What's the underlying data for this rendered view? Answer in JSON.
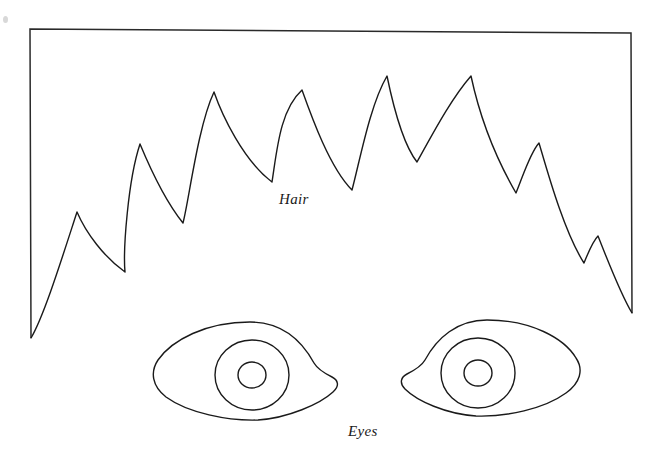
{
  "page": {
    "width": 665,
    "height": 460,
    "background_color": "#ffffff",
    "ink_color": "#1a1a1a"
  },
  "labels": {
    "hair": "Hair",
    "eyes": "Eyes"
  },
  "figure": {
    "frame": {
      "description": "open rectangle border: left vertical, top horizontal, right vertical",
      "top_left": [
        30,
        29
      ],
      "top_right": [
        631,
        33
      ],
      "left_bottom": [
        31,
        338
      ],
      "right_bottom": [
        632,
        313
      ],
      "color": "#2a2a2a"
    },
    "hair": {
      "description": "spiky zigzag hairline drawn between the two frame bottoms",
      "peaks": [
        [
          77,
          212
        ],
        [
          140,
          144
        ],
        [
          214,
          92
        ],
        [
          302,
          90
        ],
        [
          387,
          76
        ],
        [
          471,
          76
        ],
        [
          539,
          143
        ],
        [
          598,
          236
        ]
      ],
      "valleys": [
        [
          31,
          338
        ],
        [
          125,
          272
        ],
        [
          183,
          223
        ],
        [
          272,
          182
        ],
        [
          352,
          190
        ],
        [
          417,
          162
        ],
        [
          516,
          193
        ],
        [
          584,
          263
        ],
        [
          632,
          313
        ]
      ]
    },
    "eyes": [
      {
        "name": "left-eye",
        "outline_bounds": [
          155,
          322,
          190,
          98
        ],
        "iris_center": [
          252,
          375
        ],
        "iris_radius": 33,
        "pupil_center": [
          252,
          375
        ],
        "pupil_radius": 13
      },
      {
        "name": "right-eye",
        "outline_bounds": [
          400,
          320,
          178,
          95
        ],
        "iris_center": [
          478,
          375
        ],
        "iris_radius": 33,
        "pupil_center": [
          478,
          375
        ],
        "pupil_radius": 13
      }
    ]
  }
}
